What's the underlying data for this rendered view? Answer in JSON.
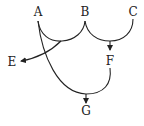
{
  "diagram": {
    "type": "directed-graph",
    "nodes": [
      {
        "id": "A",
        "label": "A",
        "x": 38,
        "y": 12
      },
      {
        "id": "B",
        "label": "B",
        "x": 85,
        "y": 12
      },
      {
        "id": "C",
        "label": "C",
        "x": 133,
        "y": 12
      },
      {
        "id": "E",
        "label": "E",
        "x": 12,
        "y": 62
      },
      {
        "id": "F",
        "label": "F",
        "x": 110,
        "y": 61
      },
      {
        "id": "G",
        "label": "G",
        "x": 86,
        "y": 111
      }
    ],
    "edges": [
      {
        "from": [
          "A",
          "B"
        ],
        "to": "E",
        "description": "arcs from A and B merge, arrow to E"
      },
      {
        "from": [
          "B",
          "C"
        ],
        "to": "F",
        "description": "arcs from B and C merge, arrow to F"
      },
      {
        "from": [
          "A",
          "F"
        ],
        "to": "G",
        "description": "arcs from A and F merge, arrow to G"
      }
    ],
    "colors": {
      "stroke": "#222222",
      "background": "#ffffff"
    }
  }
}
